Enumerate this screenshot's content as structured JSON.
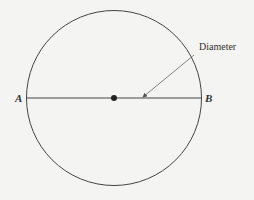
{
  "diagram": {
    "points": {
      "left": "A",
      "right": "B"
    },
    "annotation": "Diameter",
    "colors": {
      "stroke": "#444444",
      "background": "#f4f4f2"
    }
  }
}
